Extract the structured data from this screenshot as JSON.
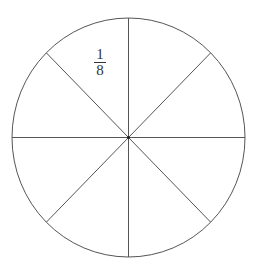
{
  "diagram": {
    "type": "fraction-circle",
    "slices": 8,
    "label": {
      "numerator": "1",
      "denominator": "8",
      "slice_index": 0
    },
    "colors": {
      "stroke": "#555555",
      "text": "#333333",
      "background": "#ffffff"
    }
  }
}
